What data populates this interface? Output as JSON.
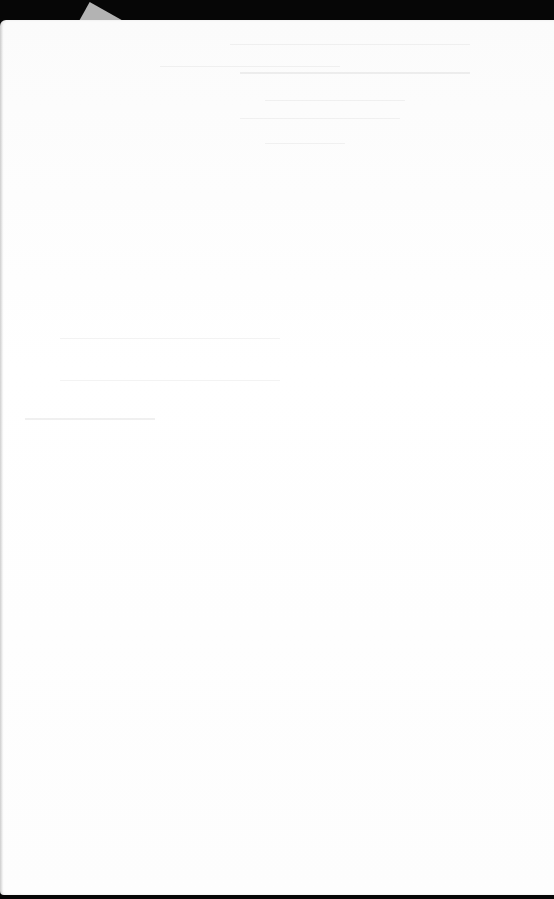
{
  "document": {
    "description": "Photograph of a blank sheet of paper (reverse side) on a dark background",
    "visible_text": "",
    "colors": {
      "background": "#060606",
      "paper": "#fdfdfd",
      "scrap": "#bdbdbd",
      "show_through": "#e8e8e8"
    },
    "show_through_lines": [
      {
        "x": 230,
        "y": 44,
        "w": 240
      },
      {
        "x": 160,
        "y": 66,
        "w": 180
      },
      {
        "x": 240,
        "y": 72,
        "w": 230,
        "bold": true
      },
      {
        "x": 265,
        "y": 100,
        "w": 140
      },
      {
        "x": 240,
        "y": 118,
        "w": 160
      },
      {
        "x": 265,
        "y": 143,
        "w": 80
      },
      {
        "x": 60,
        "y": 338,
        "w": 220
      },
      {
        "x": 60,
        "y": 380,
        "w": 220
      },
      {
        "x": 25,
        "y": 418,
        "w": 130,
        "bold": true
      }
    ]
  }
}
